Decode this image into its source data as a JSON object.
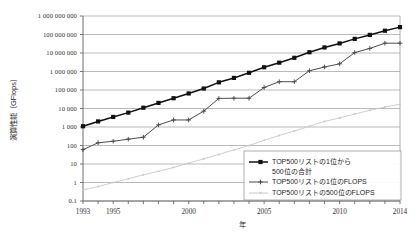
{
  "chart_data": {
    "type": "line",
    "title": "",
    "xlabel": "年",
    "ylabel": "演算性能〔GFlops〕",
    "yscale": "log",
    "ylim": [
      0.1,
      1000000000
    ],
    "xlim": [
      1993,
      2014
    ],
    "grid": true,
    "legend_position": "bottom-right",
    "ytick_labels": [
      "1 000 000 000",
      "100 000 000",
      "10 000 000",
      "1 000 000",
      "100 000",
      "10 000",
      "1 000",
      "100",
      "10",
      "1",
      "0.1"
    ],
    "ytick_values": [
      1000000000,
      100000000,
      10000000,
      1000000,
      100000,
      10000,
      1000,
      100,
      10,
      1,
      0.1
    ],
    "xtick_labels": [
      "1993",
      "1995",
      "2000",
      "2005",
      "2010",
      "2014"
    ],
    "xtick_values": [
      1993,
      1995,
      2000,
      2005,
      2010,
      2014
    ],
    "x": [
      1993,
      1994,
      1995,
      1996,
      1997,
      1998,
      1999,
      2000,
      2001,
      2002,
      2003,
      2004,
      2005,
      2006,
      2007,
      2008,
      2009,
      2010,
      2011,
      2012,
      2013,
      2014
    ],
    "series": [
      {
        "name": "TOP500リストの1位から500位の合計",
        "color": "#111111",
        "marker": "square-filled",
        "values": [
          1100,
          2000,
          3500,
          6000,
          11000,
          20000,
          36000,
          65000,
          120000,
          260000,
          450000,
          850000,
          1700000,
          3000000,
          5500000,
          11000000,
          20000000,
          33000000,
          58000000,
          95000000,
          160000000,
          250000000
        ]
      },
      {
        "name": "TOP500リストの1位のFLOPS",
        "color": "#4d4d4d",
        "marker": "plus",
        "values": [
          60,
          140,
          170,
          220,
          280,
          1300,
          2400,
          2400,
          7200,
          35000,
          36000,
          36000,
          136000,
          280000,
          280000,
          1100000,
          1750000,
          2600000,
          10500000,
          17600000,
          33900000,
          33900000
        ]
      },
      {
        "name": "TOP500リストの500位のFLOPS",
        "color": "#c8c8c8",
        "marker": "dot",
        "values": [
          0.4,
          0.6,
          1.0,
          1.6,
          2.6,
          4.0,
          6.5,
          11,
          19,
          33,
          58,
          100,
          190,
          350,
          600,
          1100,
          2000,
          3100,
          5000,
          8000,
          12000,
          17000
        ]
      }
    ]
  }
}
